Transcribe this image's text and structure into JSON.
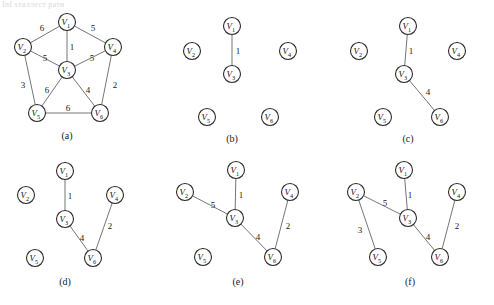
{
  "figure": {
    "scan_artifact_text": "Inf ѕталлест ратн",
    "node_label_base": "V",
    "nodes": [
      "1",
      "2",
      "3",
      "4",
      "5",
      "6"
    ]
  },
  "panels": [
    {
      "id": "a",
      "caption": "(a)",
      "nodes": [
        {
          "name": "V1",
          "sub": "1",
          "x": 67,
          "y": 22
        },
        {
          "name": "V2",
          "sub": "2",
          "x": 23,
          "y": 47
        },
        {
          "name": "V3",
          "sub": "3",
          "x": 67,
          "y": 70
        },
        {
          "name": "V4",
          "sub": "4",
          "x": 113,
          "y": 47
        },
        {
          "name": "V5",
          "sub": "5",
          "x": 37,
          "y": 113
        },
        {
          "name": "V6",
          "sub": "6",
          "x": 100,
          "y": 113
        }
      ],
      "edges": [
        {
          "from": "V1",
          "to": "V2",
          "weight": "6",
          "lx": 42,
          "ly": 28
        },
        {
          "from": "V1",
          "to": "V3",
          "weight": "1",
          "lx": 72,
          "ly": 47
        },
        {
          "from": "V1",
          "to": "V4",
          "weight": "5",
          "lx": 93,
          "ly": 28
        },
        {
          "from": "V2",
          "to": "V3",
          "weight": "5",
          "lx": 45,
          "ly": 58
        },
        {
          "from": "V2",
          "to": "V5",
          "weight": "3",
          "lx": 23,
          "ly": 85
        },
        {
          "from": "V3",
          "to": "V4",
          "weight": "5",
          "lx": 92,
          "ly": 58
        },
        {
          "from": "V3",
          "to": "V5",
          "weight": "6",
          "lx": 47,
          "ly": 90
        },
        {
          "from": "V3",
          "to": "V6",
          "weight": "4",
          "lx": 88,
          "ly": 90
        },
        {
          "from": "V4",
          "to": "V6",
          "weight": "2",
          "lx": 115,
          "ly": 85
        },
        {
          "from": "V5",
          "to": "V6",
          "weight": "6",
          "lx": 68,
          "ly": 108
        }
      ]
    },
    {
      "id": "b",
      "caption": "(b)",
      "nodes": [
        {
          "name": "V1",
          "sub": "1",
          "x": 232,
          "y": 26
        },
        {
          "name": "V2",
          "sub": "2",
          "x": 192,
          "y": 51
        },
        {
          "name": "V3",
          "sub": "3",
          "x": 232,
          "y": 74
        },
        {
          "name": "V4",
          "sub": "4",
          "x": 288,
          "y": 51
        },
        {
          "name": "V5",
          "sub": "5",
          "x": 207,
          "y": 117
        },
        {
          "name": "V6",
          "sub": "6",
          "x": 270,
          "y": 117
        }
      ],
      "edges": [
        {
          "from": "V1",
          "to": "V3",
          "weight": "1",
          "lx": 238,
          "ly": 51
        }
      ]
    },
    {
      "id": "c",
      "caption": "(c)",
      "nodes": [
        {
          "name": "V1",
          "sub": "1",
          "x": 408,
          "y": 26
        },
        {
          "name": "V2",
          "sub": "2",
          "x": 359,
          "y": 51
        },
        {
          "name": "V3",
          "sub": "3",
          "x": 404,
          "y": 74
        },
        {
          "name": "V4",
          "sub": "4",
          "x": 457,
          "y": 51
        },
        {
          "name": "V5",
          "sub": "5",
          "x": 383,
          "y": 117
        },
        {
          "name": "V6",
          "sub": "6",
          "x": 440,
          "y": 117
        }
      ],
      "edges": [
        {
          "from": "V1",
          "to": "V3",
          "weight": "1",
          "lx": 411,
          "ly": 51
        },
        {
          "from": "V3",
          "to": "V6",
          "weight": "4",
          "lx": 428,
          "ly": 92
        }
      ]
    },
    {
      "id": "d",
      "caption": "(d)",
      "nodes": [
        {
          "name": "V1",
          "sub": "1",
          "x": 65,
          "y": 171
        },
        {
          "name": "V2",
          "sub": "2",
          "x": 26,
          "y": 195
        },
        {
          "name": "V3",
          "sub": "3",
          "x": 65,
          "y": 219
        },
        {
          "name": "V4",
          "sub": "4",
          "x": 115,
          "y": 195
        },
        {
          "name": "V5",
          "sub": "5",
          "x": 35,
          "y": 258
        },
        {
          "name": "V6",
          "sub": "6",
          "x": 93,
          "y": 258
        }
      ],
      "edges": [
        {
          "from": "V1",
          "to": "V3",
          "weight": "1",
          "lx": 70,
          "ly": 196
        },
        {
          "from": "V3",
          "to": "V6",
          "weight": "4",
          "lx": 82,
          "ly": 238
        },
        {
          "from": "V4",
          "to": "V6",
          "weight": "2",
          "lx": 110,
          "ly": 226
        }
      ]
    },
    {
      "id": "e",
      "caption": "(e)",
      "nodes": [
        {
          "name": "V1",
          "sub": "1",
          "x": 236,
          "y": 170
        },
        {
          "name": "V2",
          "sub": "2",
          "x": 185,
          "y": 192
        },
        {
          "name": "V3",
          "sub": "3",
          "x": 235,
          "y": 218
        },
        {
          "name": "V4",
          "sub": "4",
          "x": 290,
          "y": 192
        },
        {
          "name": "V5",
          "sub": "5",
          "x": 203,
          "y": 257
        },
        {
          "name": "V6",
          "sub": "6",
          "x": 273,
          "y": 257
        }
      ],
      "edges": [
        {
          "from": "V1",
          "to": "V3",
          "weight": "1",
          "lx": 241,
          "ly": 195
        },
        {
          "from": "V2",
          "to": "V3",
          "weight": "5",
          "lx": 213,
          "ly": 205
        },
        {
          "from": "V3",
          "to": "V6",
          "weight": "4",
          "lx": 258,
          "ly": 237
        },
        {
          "from": "V4",
          "to": "V6",
          "weight": "2",
          "lx": 288,
          "ly": 226
        }
      ]
    },
    {
      "id": "f",
      "caption": "(f)",
      "nodes": [
        {
          "name": "V1",
          "sub": "1",
          "x": 404,
          "y": 170
        },
        {
          "name": "V2",
          "sub": "2",
          "x": 356,
          "y": 192
        },
        {
          "name": "V3",
          "sub": "3",
          "x": 408,
          "y": 218
        },
        {
          "name": "V4",
          "sub": "4",
          "x": 457,
          "y": 192
        },
        {
          "name": "V5",
          "sub": "5",
          "x": 378,
          "y": 257
        },
        {
          "name": "V6",
          "sub": "6",
          "x": 440,
          "y": 257
        }
      ],
      "edges": [
        {
          "from": "V1",
          "to": "V3",
          "weight": "1",
          "lx": 410,
          "ly": 195
        },
        {
          "from": "V2",
          "to": "V3",
          "weight": "5",
          "lx": 385,
          "ly": 203
        },
        {
          "from": "V2",
          "to": "V5",
          "weight": "3",
          "lx": 360,
          "ly": 230
        },
        {
          "from": "V3",
          "to": "V6",
          "weight": "4",
          "lx": 428,
          "ly": 237
        },
        {
          "from": "V4",
          "to": "V6",
          "weight": "2",
          "lx": 457,
          "ly": 226
        }
      ]
    }
  ],
  "captions": {
    "a": "(a)",
    "b": "(b)",
    "c": "(c)",
    "d": "(d)",
    "e": "(e)",
    "f": "(f)"
  },
  "colors": {
    "node_stroke": "#2b2b2b",
    "edge_stroke": "#6e6e6e",
    "text": "#1a1a1a",
    "background": "#ffffff"
  }
}
